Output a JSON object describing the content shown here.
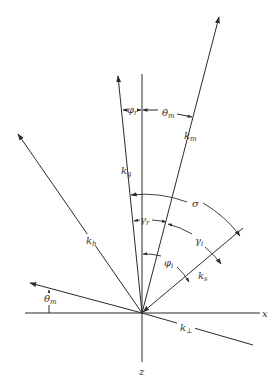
{
  "diagram": {
    "origin": {
      "x": 142,
      "y": 313
    },
    "colors": {
      "line": "#2a2a2a",
      "text": "#333333",
      "background": "#ffffff"
    },
    "axes": {
      "x_label": "x",
      "z_label": "z"
    },
    "vectors": {
      "k_m": {
        "base": "k",
        "sub": "m"
      },
      "k_g": {
        "base": "k",
        "sub": "g"
      },
      "k_h": {
        "base": "k",
        "sub": "h"
      },
      "k_s": {
        "base": "k",
        "sub": "s"
      },
      "k_perp": {
        "base": "k",
        "sub": "⊥"
      }
    },
    "angles": {
      "phi_r": {
        "base": "φ",
        "sub": "r"
      },
      "theta_m_top": {
        "base": "θ",
        "sub": "m"
      },
      "sigma": {
        "base": "σ",
        "sub": ""
      },
      "gamma_r": {
        "base": "γ",
        "sub": "r"
      },
      "gamma_i": {
        "base": "γ",
        "sub": "i"
      },
      "phi_i": {
        "base": "φ",
        "sub": "i"
      },
      "theta_m_bottom": {
        "base": "θ",
        "sub": "m"
      }
    }
  }
}
